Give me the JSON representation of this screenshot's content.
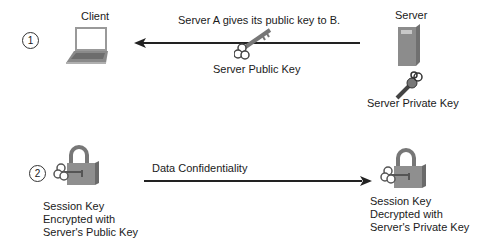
{
  "step1": {
    "number": "1",
    "client_label": "Client",
    "arrow_label": "Server A gives its public key to B.",
    "public_key_label": "Server Public Key",
    "server_label": "Server",
    "private_key_label": "Server Private Key"
  },
  "step2": {
    "number": "2",
    "arrow_label": "Data Confidentiality",
    "left_lock_label": [
      "Session Key",
      "Encrypted with",
      "Server's Public Key"
    ],
    "right_lock_label": [
      "Session Key",
      "Decrypted with",
      "Server's Private Key"
    ]
  },
  "colors": {
    "line": "#222222",
    "icon_gray": "#8a8a8a",
    "icon_dark": "#555555"
  }
}
